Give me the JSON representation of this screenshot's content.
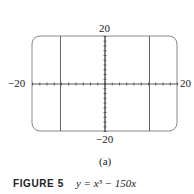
{
  "chart_data": {
    "type": "line",
    "figure_label": "FIGURE 5",
    "equation": "y = x³ − 150x",
    "subcaption": "(a)",
    "xlim": [
      -20,
      20
    ],
    "ylim": [
      -20,
      20
    ],
    "x_tick_labels": [
      "−20",
      "20"
    ],
    "y_tick_labels": [
      "20",
      "−20"
    ],
    "grid": false,
    "series": [
      {
        "name": "y = x³ − 150x",
        "description": "Only near-vertical segments visible within window",
        "x_at_crossings": [
          -12.25,
          0,
          12.25
        ]
      }
    ]
  },
  "labels": {
    "y_top": "20",
    "y_bottom": "−20",
    "x_left": "−20",
    "x_right": "20",
    "sub": "(a)",
    "fig": "FIGURE 5",
    "eq": "y = x³ − 150x"
  }
}
